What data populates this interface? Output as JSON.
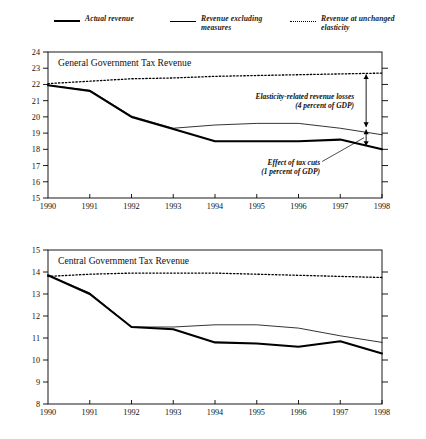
{
  "legend": {
    "items": [
      {
        "label": "Actual revenue",
        "style": "thick-solid",
        "color": "#000000"
      },
      {
        "label": "Revenue excluding\nmeasures",
        "style": "thin-solid",
        "color": "#000000"
      },
      {
        "label": "Revenue at unchanged\nelasticity",
        "style": "dotted",
        "color": "#000000"
      }
    ]
  },
  "chart_data": [
    {
      "type": "line",
      "title": "General Government Tax Revenue",
      "xlabel": "",
      "ylabel": "",
      "x": [
        1990,
        1991,
        1992,
        1993,
        1994,
        1995,
        1996,
        1997,
        1998
      ],
      "xtick_labels": [
        "1990",
        "1991",
        "1992",
        "1993",
        "1994",
        "1995",
        "1996",
        "1997",
        "1998"
      ],
      "ytick_labels": [
        "15",
        "16",
        "17",
        "18",
        "19",
        "20",
        "21",
        "22",
        "23",
        "24"
      ],
      "ylim": [
        15,
        24
      ],
      "xlim": [
        1990,
        1998
      ],
      "grid": false,
      "legend_position": "above-figure",
      "series": [
        {
          "name": "Actual revenue",
          "style": "thick-solid",
          "values": [
            21.95,
            21.6,
            20.0,
            19.25,
            18.5,
            18.5,
            18.5,
            18.6,
            18.0
          ]
        },
        {
          "name": "Revenue excluding measures",
          "style": "thin-solid",
          "values": [
            21.95,
            21.65,
            20.05,
            19.3,
            19.5,
            19.6,
            19.6,
            19.3,
            18.9
          ]
        },
        {
          "name": "Revenue at unchanged elasticity",
          "style": "dotted",
          "values": [
            22.05,
            22.2,
            22.35,
            22.4,
            22.5,
            22.55,
            22.6,
            22.65,
            22.7
          ]
        }
      ],
      "annotations": [
        {
          "text": "Elasticity-related revenue losses\n(4 percent of GDP)",
          "anchor_year": 1997.6,
          "type": "arrow-bracket"
        },
        {
          "text": "Effect of tax cuts\n(1 percent of GDP)",
          "anchor_year": 1997.6,
          "type": "arrow-bracket"
        }
      ]
    },
    {
      "type": "line",
      "title": "Central Government Tax Revenue",
      "xlabel": "",
      "ylabel": "",
      "x": [
        1990,
        1991,
        1992,
        1993,
        1994,
        1995,
        1996,
        1997,
        1998
      ],
      "xtick_labels": [
        "1990",
        "1991",
        "1992",
        "1993",
        "1994",
        "1995",
        "1996",
        "1997",
        "1998"
      ],
      "ytick_labels": [
        "8",
        "9",
        "10",
        "11",
        "12",
        "13",
        "14",
        "15"
      ],
      "ylim": [
        8,
        15
      ],
      "xlim": [
        1990,
        1998
      ],
      "grid": false,
      "legend_position": "above-figure",
      "series": [
        {
          "name": "Actual revenue",
          "style": "thick-solid",
          "values": [
            13.85,
            13.0,
            11.5,
            11.4,
            10.8,
            10.75,
            10.6,
            10.85,
            10.3
          ]
        },
        {
          "name": "Revenue excluding measures",
          "style": "thin-solid",
          "values": [
            13.85,
            13.05,
            11.5,
            11.5,
            11.6,
            11.6,
            11.45,
            11.1,
            10.8
          ]
        },
        {
          "name": "Revenue at unchanged elasticity",
          "style": "dotted",
          "values": [
            13.8,
            13.9,
            13.95,
            13.95,
            13.95,
            13.9,
            13.85,
            13.8,
            13.75
          ]
        }
      ],
      "annotations": []
    }
  ]
}
